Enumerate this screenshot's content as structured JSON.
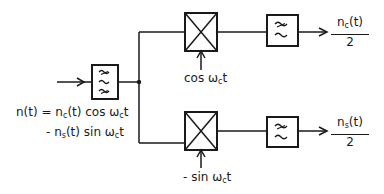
{
  "diagram": {
    "type": "quadrature demodulator block diagram",
    "input": {
      "signal_line1": "n(t) = n",
      "signal_line1_sub": "c",
      "signal_line1_rest": "(t) cos ω",
      "signal_line1_sub2": "c",
      "signal_line1_end": "t",
      "signal_line2": "- n",
      "signal_line2_sub": "s",
      "signal_line2_rest": "(t) sin ω",
      "signal_line2_sub2": "c",
      "signal_line2_end": "t",
      "full_text": "n(t) = n_c(t) cos ω_c t - n_s(t) sin ω_c t"
    },
    "blocks": [
      {
        "id": "bandpass-filter",
        "symbol": "three tildes (bandpass)"
      },
      {
        "id": "mixer-top",
        "symbol": "crossed box (multiplier)"
      },
      {
        "id": "mixer-bottom",
        "symbol": "crossed box (multiplier)"
      },
      {
        "id": "lowpass-top",
        "symbol": "two tildes (lowpass)"
      },
      {
        "id": "lowpass-bottom",
        "symbol": "two tildes (lowpass)"
      }
    ],
    "oscillators": {
      "top": {
        "prefix": "cos ω",
        "sub": "c",
        "suffix": "t",
        "full_text": "cos ω_c t"
      },
      "bottom": {
        "prefix": "- sin ω",
        "sub": "c",
        "suffix": "t",
        "full_text": "-sin ω_c t"
      }
    },
    "outputs": {
      "top": {
        "num_prefix": "n",
        "num_sub": "c",
        "num_suffix": "(t)",
        "den": "2",
        "full_text": "n_c(t)/2"
      },
      "bottom": {
        "num_prefix": "n",
        "num_sub": "s",
        "num_suffix": "(t)",
        "den": "2",
        "full_text": "n_s(t)/2"
      }
    },
    "colors": {
      "stroke": "#1a1a1a",
      "background": "#ffffff"
    }
  }
}
